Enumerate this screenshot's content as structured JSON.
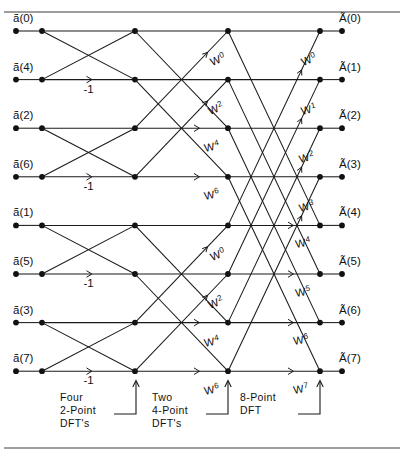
{
  "figure": {
    "width": 404,
    "height": 457,
    "background": "#ffffff",
    "line_color": "#1a1a1a",
    "rule_color": "#3c3c3c"
  },
  "inputs": [
    {
      "label": "ã(0)",
      "index": 0,
      "row": 0
    },
    {
      "label": "ã(4)",
      "index": 4,
      "row": 1
    },
    {
      "label": "ã(2)",
      "index": 2,
      "row": 2
    },
    {
      "label": "ã(6)",
      "index": 6,
      "row": 3
    },
    {
      "label": "ã(1)",
      "index": 1,
      "row": 4
    },
    {
      "label": "ã(5)",
      "index": 5,
      "row": 5
    },
    {
      "label": "ã(3)",
      "index": 3,
      "row": 6
    },
    {
      "label": "ã(7)",
      "index": 7,
      "row": 7
    }
  ],
  "outputs": [
    {
      "label": "Ã(0)",
      "index": 0,
      "row": 0
    },
    {
      "label": "Ã(1)",
      "index": 1,
      "row": 1
    },
    {
      "label": "Ã(2)",
      "index": 2,
      "row": 2
    },
    {
      "label": "Ã(3)",
      "index": 3,
      "row": 3
    },
    {
      "label": "Ã(4)",
      "index": 4,
      "row": 4
    },
    {
      "label": "Ã(5)",
      "index": 5,
      "row": 5
    },
    {
      "label": "Ã(6)",
      "index": 6,
      "row": 6
    },
    {
      "label": "Ã(7)",
      "index": 7,
      "row": 7
    }
  ],
  "stage1": {
    "name": "Four 2-Point DFT's",
    "multiplier_labels": [
      {
        "text": "-1",
        "row": 1
      },
      {
        "text": "-1",
        "row": 3
      },
      {
        "text": "-1",
        "row": 5
      },
      {
        "text": "-1",
        "row": 7
      }
    ]
  },
  "stage2": {
    "name": "Two 4-Point DFT's",
    "twiddles": [
      {
        "base": "W",
        "exponent": "0",
        "row": 0
      },
      {
        "base": "W",
        "exponent": "2",
        "row": 1
      },
      {
        "base": "W",
        "exponent": "4",
        "row": 2
      },
      {
        "base": "W",
        "exponent": "6",
        "row": 3
      },
      {
        "base": "W",
        "exponent": "0",
        "row": 4
      },
      {
        "base": "W",
        "exponent": "2",
        "row": 5
      },
      {
        "base": "W",
        "exponent": "4",
        "row": 6
      },
      {
        "base": "W",
        "exponent": "6",
        "row": 7
      }
    ]
  },
  "stage3": {
    "name": "8-Point DFT",
    "twiddles": [
      {
        "base": "W",
        "exponent": "0",
        "row": 0
      },
      {
        "base": "W",
        "exponent": "1",
        "row": 1
      },
      {
        "base": "W",
        "exponent": "2",
        "row": 2
      },
      {
        "base": "W",
        "exponent": "3",
        "row": 3
      },
      {
        "base": "W",
        "exponent": "4",
        "row": 4
      },
      {
        "base": "W",
        "exponent": "5",
        "row": 5
      },
      {
        "base": "W",
        "exponent": "6",
        "row": 6
      },
      {
        "base": "W",
        "exponent": "7",
        "row": 7
      }
    ]
  },
  "stage_captions": [
    {
      "lines": [
        "Four",
        "2-Point",
        "DFT's"
      ],
      "key": "four-2-point"
    },
    {
      "lines": [
        "Two",
        "4-Point",
        "DFT's"
      ],
      "key": "two-4-point"
    },
    {
      "lines": [
        "8-Point",
        "DFT",
        ""
      ],
      "key": "eight-point"
    }
  ],
  "chart_data": {
    "type": "diagram",
    "diagram_kind": "fft-butterfly-signal-flow-graph",
    "n_points": 8,
    "n_stages": 3,
    "n_rows": 8,
    "input_order": [
      0,
      4,
      2,
      6,
      1,
      5,
      3,
      7
    ],
    "output_order": [
      0,
      1,
      2,
      3,
      4,
      5,
      6,
      7
    ],
    "column_x": [
      16,
      42,
      135,
      228,
      320,
      342
    ],
    "row_y": [
      31,
      79.6,
      128.2,
      176.8,
      225.4,
      274,
      322.6,
      371.2
    ],
    "stages": [
      {
        "stage": 1,
        "name": "Four 2-Point DFT's",
        "butterfly_span": 1,
        "from_x": 42,
        "to_x": 135,
        "pairs": [
          [
            0,
            1
          ],
          [
            2,
            3
          ],
          [
            4,
            5
          ],
          [
            6,
            7
          ]
        ],
        "coefficients": [
          "1",
          "-1",
          "1",
          "-1",
          "1",
          "-1",
          "1",
          "-1"
        ],
        "labels_shown": [
          "-1",
          "-1",
          "-1",
          "-1"
        ],
        "label_rows": [
          1,
          3,
          5,
          7
        ]
      },
      {
        "stage": 2,
        "name": "Two 4-Point DFT's",
        "butterfly_span": 2,
        "from_x": 135,
        "to_x": 228,
        "pairs": [
          [
            0,
            2
          ],
          [
            1,
            3
          ],
          [
            4,
            6
          ],
          [
            5,
            7
          ]
        ],
        "twiddle_exponents": [
          0,
          2,
          4,
          6,
          0,
          2,
          4,
          6
        ]
      },
      {
        "stage": 3,
        "name": "8-Point DFT",
        "butterfly_span": 4,
        "from_x": 228,
        "to_x": 320,
        "pairs": [
          [
            0,
            4
          ],
          [
            1,
            5
          ],
          [
            2,
            6
          ],
          [
            3,
            7
          ]
        ],
        "twiddle_exponents": [
          0,
          1,
          2,
          3,
          4,
          5,
          6,
          7
        ]
      }
    ]
  }
}
